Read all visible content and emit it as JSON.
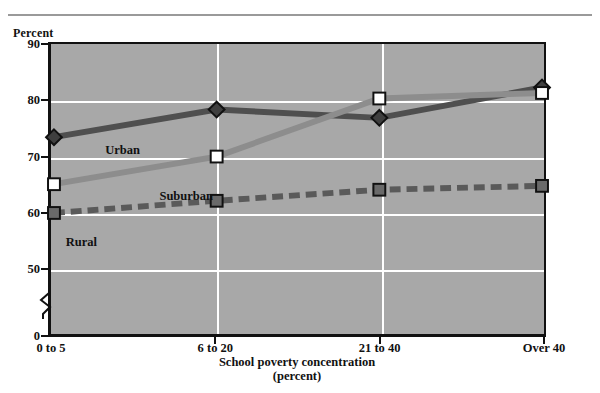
{
  "chart_data": {
    "type": "line",
    "title": "",
    "xlabel": "School poverty concentration",
    "xlabel_sub": "(percent)",
    "ylabel": "Percent",
    "categories": [
      "0 to 5",
      "6 to 20",
      "21 to 40",
      "Over 40"
    ],
    "ylim": [
      0,
      90
    ],
    "yticks": [
      90,
      80,
      70,
      60,
      50,
      0
    ],
    "y_axis_break": true,
    "y_axis_break_between": [
      50,
      0
    ],
    "grid": "horizontal-and-vertical",
    "grid_color": "#ffffff",
    "plot_background": "#a8a8a8",
    "legend_position": "inline-annotations",
    "series": [
      {
        "name": "Urban",
        "values": [
          73.5,
          78.5,
          77.0,
          82.5
        ],
        "color": "#4f4f4f",
        "marker": "diamond",
        "line_style": "solid",
        "label_x_pct": 11,
        "label_y_pct": 34
      },
      {
        "name": "Suburban",
        "values": [
          65.0,
          70.0,
          80.5,
          81.5
        ],
        "color": "#8d8d8d",
        "marker": "square",
        "line_style": "solid",
        "label_x_pct": 22,
        "label_y_pct": 50
      },
      {
        "name": "Rural",
        "values": [
          59.8,
          62.0,
          64.0,
          64.7
        ],
        "color": "#5a5a5a",
        "marker": "square",
        "line_style": "dashed",
        "label_x_pct": 3,
        "label_y_pct": 66
      }
    ]
  },
  "axis": {
    "y_caption": "Percent",
    "y_tick_labels": [
      "90",
      "80",
      "70",
      "60",
      "50",
      "0"
    ],
    "x_tick_labels": [
      "0 to 5",
      "6 to 20",
      "21 to 40",
      "Over 40"
    ],
    "x_title": "School poverty concentration",
    "x_title_sub": "(percent)"
  }
}
